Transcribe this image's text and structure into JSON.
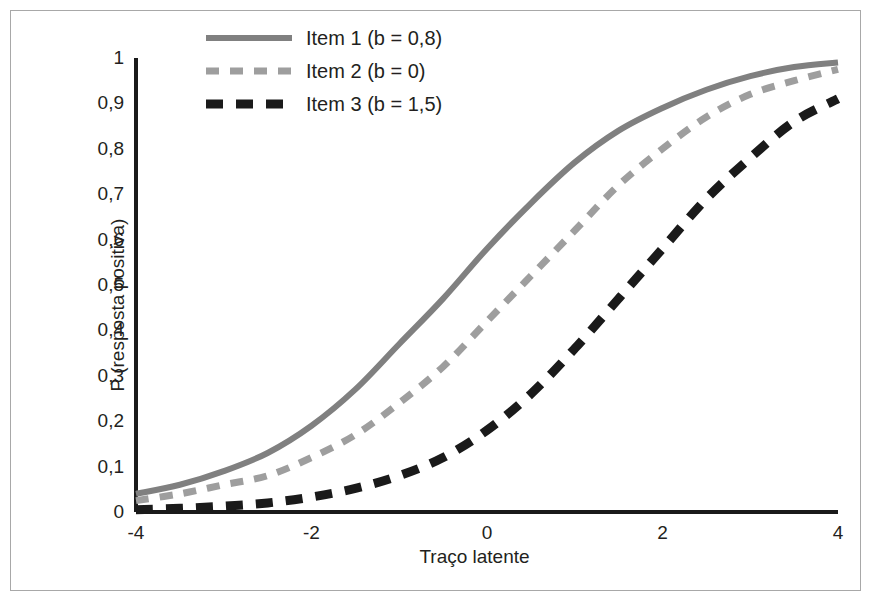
{
  "chart_data": {
    "type": "line",
    "title": "",
    "xlabel": "Traço latente",
    "ylabel": "P (resposta positiva)",
    "xlim": [
      -4,
      4
    ],
    "ylim": [
      0,
      1
    ],
    "grid": false,
    "legend_position": "top-left",
    "xticks": [
      "-4",
      "-2",
      "0",
      "2",
      "4"
    ],
    "xtick_values": [
      -4,
      -2,
      0,
      2,
      4
    ],
    "yticks": [
      "0",
      "0,1",
      "0,2",
      "0,3",
      "0,4",
      "0,5",
      "0,6",
      "0,7",
      "0,8",
      "0,9",
      "1"
    ],
    "ytick_values": [
      0,
      0.1,
      0.2,
      0.3,
      0.4,
      0.5,
      0.6,
      0.7,
      0.8,
      0.9,
      1
    ],
    "x": [
      -4,
      -3.5,
      -3,
      -2.5,
      -2,
      -1.5,
      -1,
      -0.5,
      0,
      0.5,
      1,
      1.5,
      2,
      2.5,
      3,
      3.5,
      4
    ],
    "series": [
      {
        "name": "Item 1 (b = 0,8)",
        "color": "#808080",
        "style": "solid",
        "b": 0.8,
        "values": [
          0.04,
          0.06,
          0.09,
          0.13,
          0.19,
          0.27,
          0.37,
          0.47,
          0.58,
          0.68,
          0.77,
          0.84,
          0.89,
          0.93,
          0.96,
          0.98,
          0.99
        ]
      },
      {
        "name": "Item 2 (b = 0)",
        "color": "#9e9e9e",
        "style": "dashed",
        "b": 0.0,
        "values": [
          0.025,
          0.04,
          0.06,
          0.08,
          0.12,
          0.17,
          0.24,
          0.32,
          0.42,
          0.52,
          0.62,
          0.72,
          0.8,
          0.87,
          0.92,
          0.95,
          0.975
        ]
      },
      {
        "name": "Item 3 (b = 1,5)",
        "color": "#1a1a1a",
        "style": "dashed-thick",
        "b": 1.5,
        "values": [
          0.005,
          0.008,
          0.013,
          0.02,
          0.033,
          0.052,
          0.08,
          0.12,
          0.18,
          0.26,
          0.36,
          0.47,
          0.58,
          0.69,
          0.78,
          0.86,
          0.91
        ]
      }
    ]
  },
  "axes": {
    "x_label": "Traço latente",
    "y_label": "P (resposta positiva)"
  },
  "legend": {
    "items": [
      {
        "label": "Item 1 (b = 0,8)"
      },
      {
        "label": "Item 2 (b = 0)"
      },
      {
        "label": "Item 3 (b = 1,5)"
      }
    ]
  }
}
